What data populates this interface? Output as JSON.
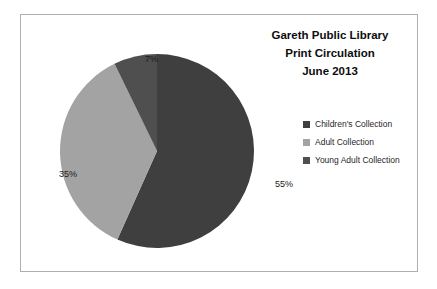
{
  "chart_data": {
    "type": "pie",
    "title": "Gareth Public Library Print Circulation June 2013",
    "title_lines": [
      "Gareth Public Library",
      "Print Circulation",
      "June 2013"
    ],
    "categories": [
      "Children's Collection",
      "Adult Collection",
      "Young Adult Collection"
    ],
    "values": [
      55,
      35,
      7
    ],
    "value_labels": [
      "55%",
      "35%",
      "7%"
    ],
    "unit": "%",
    "colors": [
      "#3f3f3f",
      "#a3a3a3",
      "#4f4f4f"
    ],
    "legend_position": "right",
    "start_angle_deg": 0,
    "direction": "clockwise",
    "xlabel": "",
    "ylabel": ""
  },
  "title": {
    "line1": "Gareth Public Library",
    "line2": "Print Circulation",
    "line3": "June 2013"
  },
  "labels": {
    "children": "55%",
    "adult": "35%",
    "young_adult": "7%"
  },
  "legend": {
    "items": [
      {
        "label": "Children's Collection",
        "color": "#3f3f3f"
      },
      {
        "label": "Adult Collection",
        "color": "#a3a3a3"
      },
      {
        "label": "Young Adult Collection",
        "color": "#4f4f4f"
      }
    ]
  },
  "frame": {
    "border_color": "#aeaeae",
    "background": "#ffffff"
  }
}
